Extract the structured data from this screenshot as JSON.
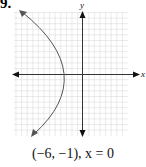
{
  "problem": {
    "number": "9."
  },
  "graph": {
    "x_axis_label": "x",
    "y_axis_label": "y",
    "grid": {
      "columns": 20,
      "rows": 22
    },
    "curve": "parabola opening left",
    "colors": {
      "grid": "#d9d9d9",
      "axis": "#333333",
      "curve": "#555555"
    }
  },
  "caption": "(−6, −1), x = 0"
}
